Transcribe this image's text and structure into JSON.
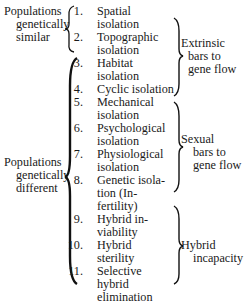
{
  "groups_left": [
    {
      "label_lines": [
        "Populations",
        "genetically",
        "similar"
      ]
    },
    {
      "label_lines": [
        "Populations",
        "genetically",
        "different"
      ]
    }
  ],
  "items": [
    {
      "num": "1.",
      "lines": [
        "Spatial",
        "isolation"
      ]
    },
    {
      "num": "2.",
      "lines": [
        "Topographic",
        "isolation"
      ]
    },
    {
      "num": "3.",
      "lines": [
        "Habitat",
        "isolation"
      ]
    },
    {
      "num": "4.",
      "lines": [
        "Cyclic isolation"
      ]
    },
    {
      "num": "5.",
      "lines": [
        "Mechanical",
        "isolation"
      ]
    },
    {
      "num": "6.",
      "lines": [
        "Psychological",
        "isolation"
      ]
    },
    {
      "num": "7.",
      "lines": [
        "Physiological",
        "isolation"
      ]
    },
    {
      "num": "8.",
      "lines": [
        "Genetic isola-",
        "tion (In-",
        "fertility)"
      ]
    },
    {
      "num": "9.",
      "lines": [
        "Hybrid in-",
        "viability"
      ]
    },
    {
      "num": "10.",
      "lines": [
        "Hybrid",
        "sterility"
      ]
    },
    {
      "num": "11.",
      "lines": [
        "Selective",
        "hybrid",
        "elimination"
      ]
    }
  ],
  "groups_right": [
    {
      "label_lines": [
        "Extrinsic",
        "bars to",
        "gene flow"
      ]
    },
    {
      "label_lines": [
        "Sexual",
        "bars to",
        "gene flow"
      ]
    },
    {
      "label_lines": [
        "Hybrid",
        "incapacity"
      ]
    }
  ]
}
